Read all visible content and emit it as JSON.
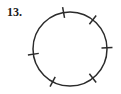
{
  "figure": {
    "problem_number": "13.",
    "type": "geometry-diagram",
    "colors": {
      "ink": "#2b2b2b",
      "label_ink": "#1a1a1a",
      "background": "#ffffff"
    },
    "circle": {
      "center_x": 70,
      "center_y": 49,
      "radius": 37,
      "stroke_width": 1.5
    },
    "tick_marks": {
      "count": 6,
      "length": 11,
      "stroke_width": 1.5,
      "angles_degrees": [
        100,
        52,
        2,
        -52,
        -118,
        -172
      ],
      "labels": [
        "tick-top",
        "tick-upper-right",
        "tick-right",
        "tick-lower-right",
        "tick-lower-left",
        "tick-left"
      ]
    }
  }
}
